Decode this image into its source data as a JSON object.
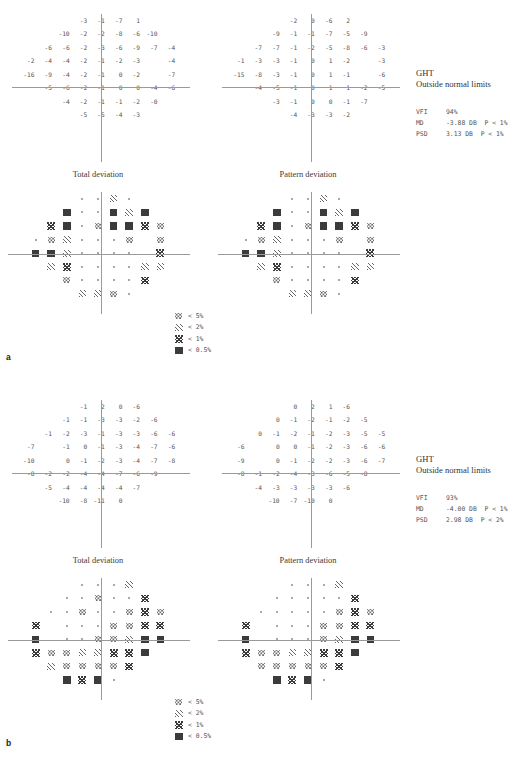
{
  "document": {
    "type": "humphrey-visual-field-printout",
    "panels": [
      "a",
      "b"
    ]
  },
  "legend": {
    "items": [
      {
        "symbol": "p5",
        "label": "< 5%"
      },
      {
        "symbol": "p2",
        "label": "< 2%"
      },
      {
        "symbol": "p1",
        "label": "< 1%"
      },
      {
        "symbol": "p05",
        "label": "< 0.5%"
      }
    ]
  },
  "panel_a": {
    "letter": "a",
    "total_deviation": {
      "caption": "Total deviation",
      "numbers": [
        [
          "",
          "",
          "",
          "-3",
          "-1",
          "-7",
          "1",
          "",
          ""
        ],
        [
          "",
          "",
          "-10",
          "-2",
          "-2",
          "-8",
          "-6",
          "-10",
          ""
        ],
        [
          "",
          "-6",
          "-6",
          "-2",
          "-3",
          "-6",
          "-9",
          "-7",
          "-4"
        ],
        [
          "-2",
          "-4",
          "-4",
          "-2",
          "-1",
          "-2",
          "-3",
          "",
          "-4"
        ],
        [
          "-16",
          "-9",
          "-4",
          "-2",
          "-1",
          "0",
          "-2",
          "",
          "-7"
        ],
        [
          "",
          "-5",
          "-6",
          "-2",
          "-1",
          "0",
          "0",
          "-4",
          "-6"
        ],
        [
          "",
          "",
          "-4",
          "-2",
          "-1",
          "-1",
          "-2",
          "-0",
          ""
        ],
        [
          "",
          "",
          "",
          "-5",
          "-5",
          "-4",
          "-3",
          "",
          ""
        ]
      ],
      "symbols": [
        [
          "",
          "",
          "",
          "n",
          "n",
          "p2",
          "n",
          "",
          ""
        ],
        [
          "",
          "",
          "p05",
          "n",
          "n",
          "p05",
          "p2",
          "p05",
          ""
        ],
        [
          "",
          "p1",
          "p05",
          "n",
          "p5",
          "p05",
          "p05",
          "p1",
          "p5"
        ],
        [
          "n",
          "p5",
          "p2",
          "n",
          "n",
          "n",
          "p5",
          "",
          "p5"
        ],
        [
          "p05",
          "p05",
          "p2",
          "n",
          "n",
          "n",
          "n",
          "",
          "p1"
        ],
        [
          "",
          "p2",
          "p1",
          "n",
          "n",
          "n",
          "n",
          "p2",
          "p2"
        ],
        [
          "",
          "",
          "p5",
          "n",
          "n",
          "n",
          "n",
          "p1",
          ""
        ],
        [
          "",
          "",
          "",
          "p2",
          "p2",
          "p5",
          "n",
          "",
          ""
        ]
      ]
    },
    "pattern_deviation": {
      "caption": "Pattern deviation",
      "numbers": [
        [
          "",
          "",
          "",
          "-2",
          "0",
          "-6",
          "2",
          "",
          ""
        ],
        [
          "",
          "",
          "-9",
          "-1",
          "-1",
          "-7",
          "-5",
          "-9",
          ""
        ],
        [
          "",
          "-7",
          "-7",
          "-1",
          "-2",
          "-5",
          "-8",
          "-6",
          "-3"
        ],
        [
          "-1",
          "-3",
          "-3",
          "-1",
          "0",
          "1",
          "-2",
          "",
          "-3"
        ],
        [
          "-15",
          "-8",
          "-3",
          "-1",
          "0",
          "1",
          "-1",
          "",
          "-6"
        ],
        [
          "",
          "-4",
          "-5",
          "-1",
          "0",
          "1",
          "1",
          "-2",
          "-5"
        ],
        [
          "",
          "",
          "-3",
          "-1",
          "0",
          "0",
          "-1",
          "-7",
          ""
        ],
        [
          "",
          "",
          "",
          "-4",
          "-3",
          "-3",
          "-2",
          "",
          ""
        ]
      ],
      "symbols": [
        [
          "",
          "",
          "",
          "n",
          "n",
          "p2",
          "n",
          "",
          ""
        ],
        [
          "",
          "",
          "p05",
          "n",
          "n",
          "p05",
          "p2",
          "p05",
          ""
        ],
        [
          "",
          "p1",
          "p05",
          "n",
          "p5",
          "p05",
          "p05",
          "p1",
          "p5"
        ],
        [
          "n",
          "p5",
          "p2",
          "n",
          "n",
          "n",
          "p5",
          "",
          "p5"
        ],
        [
          "p05",
          "p05",
          "p2",
          "n",
          "n",
          "n",
          "n",
          "",
          "p1"
        ],
        [
          "",
          "p2",
          "p1",
          "n",
          "n",
          "n",
          "n",
          "p2",
          "p2"
        ],
        [
          "",
          "",
          "p5",
          "n",
          "n",
          "n",
          "n",
          "p1",
          ""
        ],
        [
          "",
          "",
          "",
          "p2",
          "p2",
          "p5",
          "n",
          "",
          ""
        ]
      ]
    },
    "stats": {
      "ght_label": "GHT",
      "ght_result": "Outside normal limits",
      "rows": [
        {
          "key": "VFI",
          "value": "94%"
        },
        {
          "key": "MD",
          "value": "-3.88 DB  P < 1%"
        },
        {
          "key": "PSD",
          "value": "3.13 DB  P < 1%"
        }
      ]
    }
  },
  "panel_b": {
    "letter": "b",
    "total_deviation": {
      "caption": "Total deviation",
      "numbers": [
        [
          "",
          "",
          "",
          "-1",
          "2",
          "0",
          "-6",
          "",
          ""
        ],
        [
          "",
          "",
          "-1",
          "-1",
          "-3",
          "-3",
          "-2",
          "-6",
          ""
        ],
        [
          "",
          "-1",
          "-2",
          "-3",
          "-1",
          "-3",
          "-3",
          "-6",
          "-6"
        ],
        [
          "-7",
          "",
          "-1",
          "0",
          "-1",
          "-3",
          "-4",
          "-7",
          "-6"
        ],
        [
          "-10",
          "",
          "0",
          "-1",
          "-2",
          "-3",
          "-4",
          "-7",
          "-8"
        ],
        [
          "-8",
          "-2",
          "-2",
          "-4",
          "-4",
          "-7",
          "-6",
          "-9",
          ""
        ],
        [
          "",
          "-5",
          "-4",
          "-4",
          "-4",
          "-4",
          "-7",
          "",
          ""
        ],
        [
          "",
          "",
          "-10",
          "-8",
          "-11",
          "0",
          "",
          "",
          ""
        ]
      ],
      "symbols": [
        [
          "",
          "",
          "",
          "n",
          "n",
          "n",
          "p2",
          "",
          ""
        ],
        [
          "",
          "",
          "n",
          "n",
          "p5",
          "n",
          "n",
          "p1",
          ""
        ],
        [
          "",
          "n",
          "n",
          "p5",
          "n",
          "n",
          "p5",
          "p1",
          "p5"
        ],
        [
          "p1",
          "",
          "n",
          "n",
          "n",
          "p5",
          "p5",
          "p1",
          "p1"
        ],
        [
          "p05",
          "",
          "n",
          "n",
          "p5",
          "p5",
          "p2",
          "p05",
          "p05"
        ],
        [
          "p1",
          "p5",
          "p5",
          "p2",
          "p2",
          "p1",
          "p1",
          "p05",
          ""
        ],
        [
          "",
          "p2",
          "p5",
          "p5",
          "p5",
          "p5",
          "p1",
          "",
          ""
        ],
        [
          "",
          "",
          "p05",
          "p1",
          "p05",
          "n",
          "",
          "",
          ""
        ]
      ]
    },
    "pattern_deviation": {
      "caption": "Pattern deviation",
      "numbers": [
        [
          "",
          "",
          "",
          "0",
          "2",
          "1",
          "-6",
          "",
          ""
        ],
        [
          "",
          "",
          "0",
          "-1",
          "-2",
          "-1",
          "-2",
          "-5",
          ""
        ],
        [
          "",
          "0",
          "-1",
          "-2",
          "-1",
          "-2",
          "-3",
          "-5",
          "-5"
        ],
        [
          "-6",
          "",
          "0",
          "0",
          "-1",
          "-2",
          "-3",
          "-6",
          "-6"
        ],
        [
          "-9",
          "",
          "0",
          "-1",
          "-2",
          "-2",
          "-3",
          "-6",
          "-7"
        ],
        [
          "-8",
          "-1",
          "-2",
          "-4",
          "-3",
          "-6",
          "-5",
          "-8",
          ""
        ],
        [
          "",
          "-4",
          "-3",
          "-3",
          "-3",
          "-3",
          "-6",
          "",
          ""
        ],
        [
          "",
          "",
          "-10",
          "-7",
          "-10",
          "0",
          "",
          "",
          ""
        ]
      ],
      "symbols": [
        [
          "",
          "",
          "",
          "n",
          "n",
          "n",
          "p2",
          "",
          ""
        ],
        [
          "",
          "",
          "n",
          "n",
          "n",
          "n",
          "n",
          "p1",
          ""
        ],
        [
          "",
          "n",
          "n",
          "n",
          "n",
          "n",
          "p5",
          "p1",
          "p5"
        ],
        [
          "p1",
          "",
          "n",
          "n",
          "n",
          "p5",
          "p5",
          "p1",
          "p1"
        ],
        [
          "p05",
          "",
          "n",
          "n",
          "n",
          "p5",
          "p2",
          "p05",
          "p05"
        ],
        [
          "p1",
          "p5",
          "p5",
          "p2",
          "p2",
          "p1",
          "p1",
          "p05",
          ""
        ],
        [
          "",
          "p5",
          "p5",
          "p5",
          "p5",
          "p5",
          "p1",
          "",
          ""
        ],
        [
          "",
          "",
          "p05",
          "p1",
          "p05",
          "n",
          "",
          "",
          ""
        ]
      ]
    },
    "stats": {
      "ght_label": "GHT",
      "ght_result": "Outside normal limits",
      "rows": [
        {
          "key": "VFI",
          "value": "93%"
        },
        {
          "key": "MD",
          "value": "-4.00 DB  P < 1%"
        },
        {
          "key": "PSD",
          "value": "2.98 DB  P < 2%"
        }
      ]
    }
  }
}
